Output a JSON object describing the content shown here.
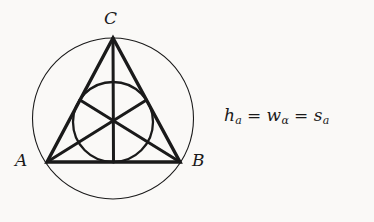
{
  "figure": {
    "background_color": "#faf9f7",
    "ink_color": "#1a1a1a",
    "caption_formula": {
      "term1_base": "h",
      "term1_sub": "a",
      "relation1": "=",
      "term2_base": "w",
      "term2_sub": "α",
      "relation2": "=",
      "term3_base": "s",
      "term3_sub": "a",
      "plain_text": "h_a = w_α = s_a"
    },
    "vertex_labels": {
      "a": "A",
      "b": "B",
      "c": "C"
    },
    "geometry": {
      "circumcircle": {
        "cx": 113,
        "cy": 118.5,
        "r": 80.5,
        "stroke_width": 1
      },
      "incircle": {
        "cx": 113,
        "cy": 122,
        "r": 40,
        "stroke_width": 2
      },
      "triangle": {
        "a": {
          "x": 47,
          "y": 162
        },
        "b": {
          "x": 180,
          "y": 162
        },
        "c": {
          "x": 113,
          "y": 38
        },
        "stroke_width": 3.2
      },
      "center_point": {
        "x": 113,
        "y": 122
      },
      "midpoints": {
        "ab": {
          "x": 113.5,
          "y": 162
        },
        "bc": {
          "x": 146.5,
          "y": 100
        },
        "ca": {
          "x": 80,
          "y": 100
        }
      },
      "cevian_stroke_width": 3.2
    }
  }
}
